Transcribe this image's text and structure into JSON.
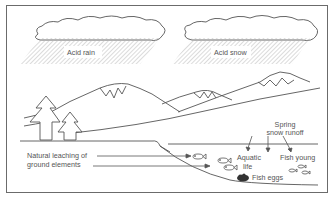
{
  "diagram": {
    "clouds": [
      {
        "id": "rain-cloud",
        "label": "Acid rain"
      },
      {
        "id": "snow-cloud",
        "label": "Acid snow"
      }
    ],
    "labels": {
      "acid_rain": "Acid rain",
      "acid_snow": "Acid snow",
      "spring_runoff_line1": "Spring",
      "spring_runoff_line2": "snow runoff",
      "leaching_line1": "Natural leaching of",
      "leaching_line2": "ground elements",
      "aquatic_line1": "Aquatic",
      "aquatic_line2": "life",
      "fish_young": "Fish young",
      "fish_eggs": "Fish eggs"
    },
    "colors": {
      "line": "#555555",
      "hatch": "#b8b8b8",
      "border": "#6b6b6b",
      "eggs": "#333333"
    }
  }
}
